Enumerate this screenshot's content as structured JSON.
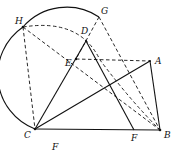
{
  "diagram": {
    "type": "geometry-construction",
    "points": {
      "A": {
        "label": "A",
        "x": 150,
        "y": 61
      },
      "B": {
        "label": "B",
        "x": 160,
        "y": 130
      },
      "C": {
        "label": "C",
        "x": 35,
        "y": 129
      },
      "D": {
        "label": "D",
        "x": 86,
        "y": 41
      },
      "E": {
        "label": "E",
        "x": 76,
        "y": 59
      },
      "F": {
        "label": "F",
        "x": 134,
        "y": 130
      },
      "G": {
        "label": "G",
        "x": 99,
        "y": 17
      },
      "H": {
        "label": "H",
        "x": 23,
        "y": 27
      }
    },
    "solid_segments": [
      "C-B",
      "C-A",
      "A-B",
      "C-D",
      "D-F"
    ],
    "dashed_segments": [
      "H-C",
      "H-B",
      "E-A",
      "G-E",
      "G-B"
    ],
    "arcs": [
      {
        "style": "solid",
        "desc": "circle arc through G, H, C"
      },
      {
        "style": "dashed",
        "desc": "arc from H through D toward B"
      }
    ],
    "caption": "F"
  }
}
